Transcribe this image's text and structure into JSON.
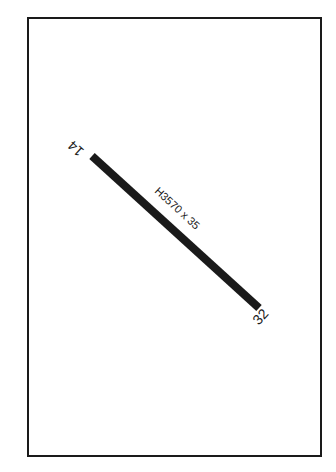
{
  "diagram": {
    "type": "airport-runway-diagram",
    "runway": {
      "surface_label": "H3570 x 35",
      "end_a": "14",
      "end_b": "32",
      "color": "#1a1a1a"
    },
    "frame_color": "#1a1a1a",
    "background": "#ffffff"
  }
}
